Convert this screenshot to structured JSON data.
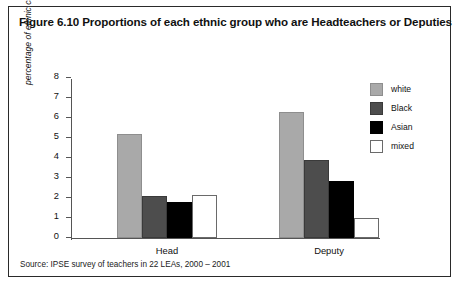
{
  "figure": {
    "title": "Figure 6.10 Proportions of each ethnic group who are Headteachers or Deputies",
    "source": "Source: IPSE survey of teachers in 22 LEAs, 2000 – 2001"
  },
  "chart_data": {
    "type": "bar",
    "title": "Figure 6.10 Proportions of each ethnic group who are Headteachers or Deputies",
    "xlabel": "",
    "ylabel": "percentage of ethnic category",
    "ylim": [
      0,
      8
    ],
    "yticks": [
      0,
      1,
      2,
      3,
      4,
      5,
      6,
      7,
      8
    ],
    "ytick_labels": [
      "0",
      "1",
      "2",
      "3",
      "4",
      "5",
      "6",
      "7",
      "8"
    ],
    "grid": false,
    "legend_position": "right",
    "categories": [
      "Head",
      "Deputy"
    ],
    "series": [
      {
        "name": "white",
        "color": "#a9a9a9",
        "values": [
          5.2,
          6.3
        ]
      },
      {
        "name": "Black",
        "color": "#4d4d4d",
        "values": [
          2.1,
          3.9
        ]
      },
      {
        "name": "Asian",
        "color": "#000000",
        "values": [
          1.8,
          2.85
        ]
      },
      {
        "name": "mixed",
        "color": "#ffffff",
        "values": [
          2.15,
          1.0
        ]
      }
    ]
  }
}
